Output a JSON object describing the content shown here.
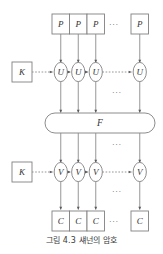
{
  "figure": {
    "caption": "그림 4.3 섀넌의 암호",
    "title_label": "그림 4.3",
    "type": "block-diagram",
    "background_color": "#ffffff",
    "stroke_color": "#808080",
    "text_color": "#333333"
  },
  "rows": {
    "plaintext": {
      "row_name": "plaintext-row",
      "shape": "rectangle",
      "nodes": [
        {
          "label": "P"
        },
        {
          "label": "P"
        },
        {
          "label": "P"
        },
        {
          "label": "P"
        }
      ],
      "ellipsis": "···"
    },
    "encrypt_state": {
      "row_name": "u-state-row",
      "shape": "ellipse",
      "key_label": "K",
      "nodes": [
        {
          "label": "U"
        },
        {
          "label": "U"
        },
        {
          "label": "U"
        },
        {
          "label": "U"
        }
      ],
      "ellipsis": "···"
    },
    "function": {
      "row_name": "function-row",
      "shape": "stadium",
      "label": "F"
    },
    "decrypt_state": {
      "row_name": "v-state-row",
      "shape": "ellipse",
      "key_label": "K",
      "nodes": [
        {
          "label": "V"
        },
        {
          "label": "V"
        },
        {
          "label": "V"
        },
        {
          "label": "V"
        }
      ],
      "ellipsis": "···"
    },
    "ciphertext": {
      "row_name": "ciphertext-row",
      "shape": "rectangle",
      "nodes": [
        {
          "label": "C"
        },
        {
          "label": "C"
        },
        {
          "label": "C"
        },
        {
          "label": "C"
        }
      ],
      "ellipsis": "···"
    }
  },
  "ellipses_markers": {
    "top_row_gap": "···",
    "u_to_f_gap": "···",
    "f_to_v_gap": "···",
    "v_to_c_gap": "···",
    "bottom_row_gap": "···"
  }
}
